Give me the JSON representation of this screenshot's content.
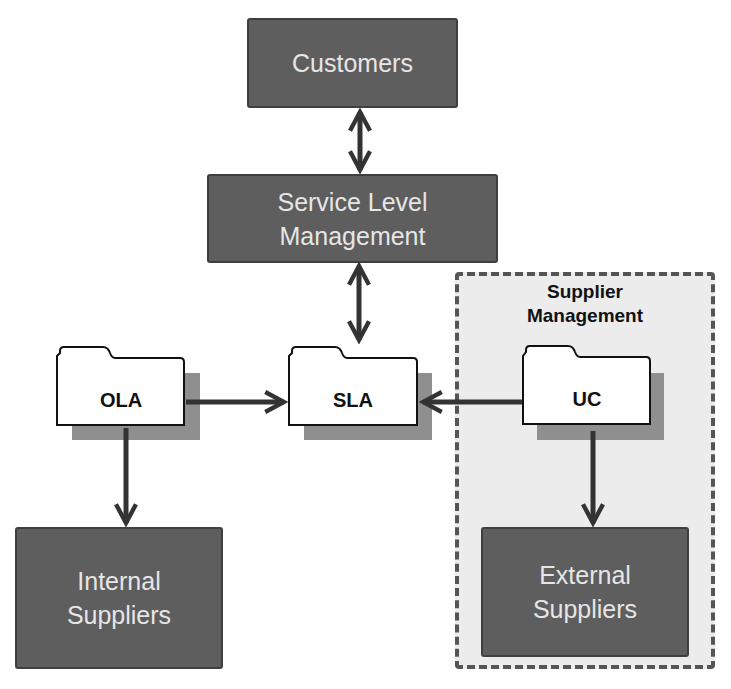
{
  "diagram": {
    "nodes": {
      "customers": {
        "label": "Customers"
      },
      "slm": {
        "line1": "Service Level",
        "line2": "Management"
      },
      "ola": {
        "label": "OLA"
      },
      "sla": {
        "label": "SLA"
      },
      "uc": {
        "label": "UC"
      },
      "internal": {
        "line1": "Internal",
        "line2": "Suppliers"
      },
      "external": {
        "line1": "External",
        "line2": "Suppliers"
      }
    },
    "group": {
      "line1": "Supplier",
      "line2": "Management"
    },
    "edges": [
      {
        "from": "Customers",
        "to": "Service Level Management",
        "type": "bidirectional"
      },
      {
        "from": "Service Level Management",
        "to": "SLA",
        "type": "bidirectional"
      },
      {
        "from": "OLA",
        "to": "SLA",
        "type": "directed"
      },
      {
        "from": "UC",
        "to": "SLA",
        "type": "directed"
      },
      {
        "from": "OLA",
        "to": "Internal Suppliers",
        "type": "directed"
      },
      {
        "from": "UC",
        "to": "External Suppliers",
        "type": "directed"
      }
    ],
    "colors": {
      "box_fill": "#5e5e5e",
      "box_text": "#e6e6e6",
      "arrow": "#333333",
      "group_fill": "#ececec",
      "group_border": "#555555"
    }
  }
}
